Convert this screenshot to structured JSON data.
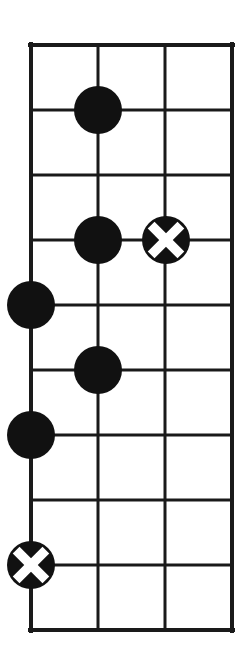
{
  "diagram": {
    "type": "fretboard-grid",
    "background_color": "#ffffff",
    "line_color": "#1a1a1a",
    "marker_fill_color": "#111111",
    "marker_cross_color": "#ffffff",
    "canvas": {
      "width": 247,
      "height": 662
    },
    "grid": {
      "string_count": 4,
      "fret_line_count": 10,
      "fret_space_count": 9,
      "string_x": [
        31,
        98,
        165,
        232
      ],
      "fret_y": [
        45,
        110,
        175,
        240,
        305,
        370,
        435,
        500,
        565,
        630
      ],
      "outer_border_width": 4,
      "inner_line_width": 3
    },
    "markers": [
      {
        "id": "marker-1",
        "kind": "filled-dot",
        "string": 2,
        "fret_line": 2,
        "cx": 98,
        "cy": 110,
        "r": 24
      },
      {
        "id": "marker-2",
        "kind": "filled-dot",
        "string": 2,
        "fret_line": 4,
        "cx": 98,
        "cy": 240,
        "r": 24
      },
      {
        "id": "marker-3",
        "kind": "cross-dot",
        "string": 3,
        "fret_line": 4,
        "cx": 166,
        "cy": 240,
        "r": 24
      },
      {
        "id": "marker-4",
        "kind": "filled-dot",
        "string": 1,
        "fret_line": 5,
        "cx": 31,
        "cy": 305,
        "r": 24
      },
      {
        "id": "marker-5",
        "kind": "filled-dot",
        "string": 2,
        "fret_line": 6,
        "cx": 98,
        "cy": 370,
        "r": 24
      },
      {
        "id": "marker-6",
        "kind": "filled-dot",
        "string": 1,
        "fret_line": 7,
        "cx": 31,
        "cy": 435,
        "r": 24
      },
      {
        "id": "marker-7",
        "kind": "cross-dot",
        "string": 1,
        "fret_line": 9,
        "cx": 31,
        "cy": 565,
        "r": 24
      }
    ]
  }
}
